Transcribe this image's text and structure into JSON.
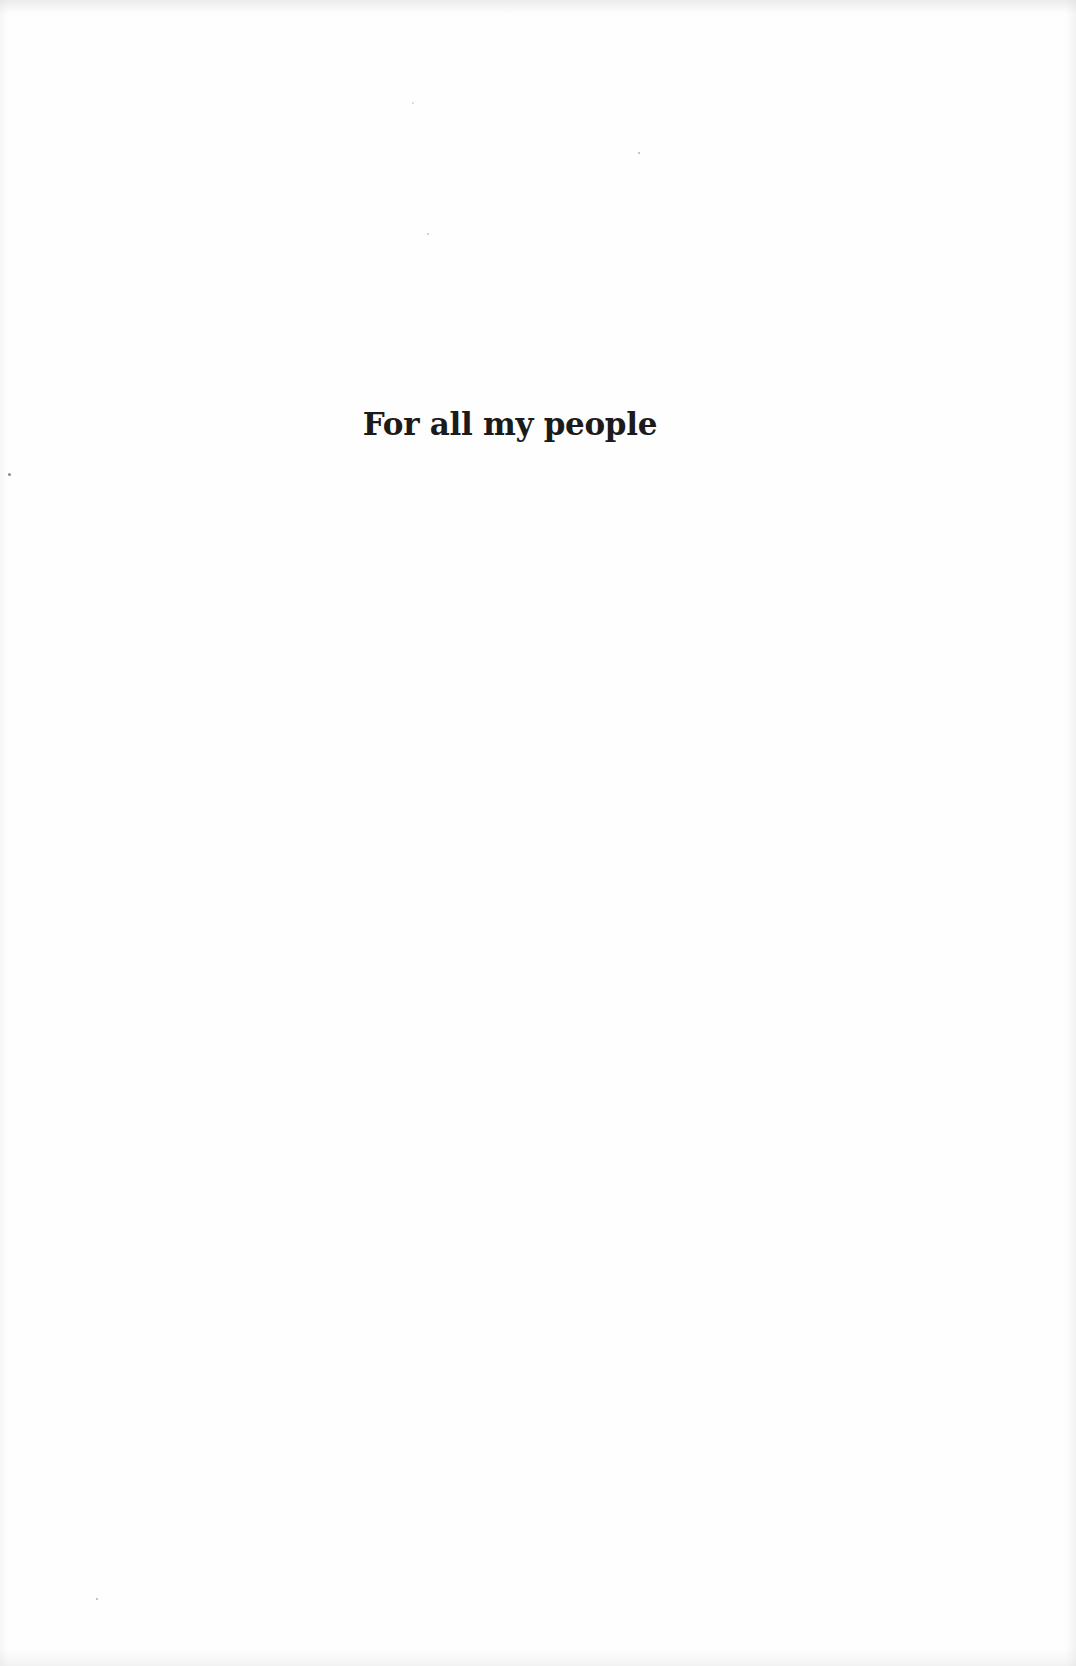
{
  "page": {
    "type": "dedication",
    "text": "For all my people",
    "colors": {
      "background": "#fefefe",
      "text": "#1b1b1b"
    }
  }
}
